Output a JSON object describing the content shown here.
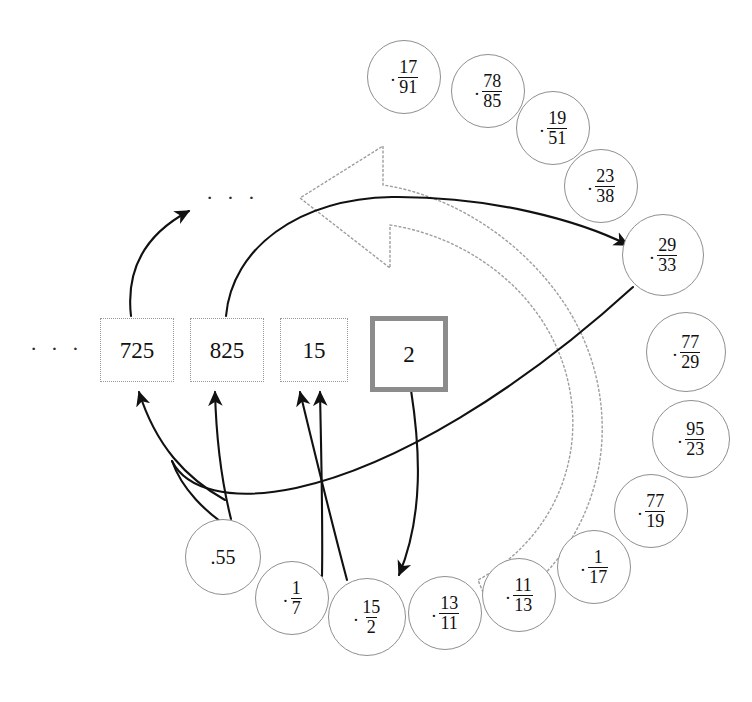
{
  "diagram": {
    "colors": {
      "box_border": "#9a9a9a",
      "active_box_border": "#8c8c8c",
      "circle_border": "#8f8f8f",
      "arrow_black": "#111111",
      "arrow_gray": "#9a9a9a",
      "background": "#ffffff"
    }
  },
  "registers": {
    "left_ellipsis": "· · ·",
    "top_ellipsis": "· · ·",
    "boxes": [
      {
        "value": "725",
        "active": false,
        "x": 100,
        "y": 318,
        "w": 72,
        "h": 62
      },
      {
        "value": "825",
        "active": false,
        "x": 190,
        "y": 318,
        "w": 72,
        "h": 62
      },
      {
        "value": "15",
        "active": false,
        "x": 280,
        "y": 318,
        "w": 66,
        "h": 62
      },
      {
        "value": "2",
        "active": true,
        "x": 370,
        "y": 316,
        "w": 68,
        "h": 66
      }
    ]
  },
  "fractions": {
    "items": [
      {
        "num": "17",
        "den": "91",
        "cx": 403,
        "cy": 76,
        "r": 36
      },
      {
        "num": "78",
        "den": "85",
        "cx": 487,
        "cy": 90,
        "r": 36
      },
      {
        "num": "19",
        "den": "51",
        "cx": 552,
        "cy": 127,
        "r": 36
      },
      {
        "num": "23",
        "den": "38",
        "cx": 600,
        "cy": 185,
        "r": 36
      },
      {
        "num": "29",
        "den": "33",
        "cx": 662,
        "cy": 254,
        "r": 40
      },
      {
        "num": "77",
        "den": "29",
        "cx": 685,
        "cy": 351,
        "r": 39
      },
      {
        "num": "95",
        "den": "23",
        "cx": 690,
        "cy": 438,
        "r": 38
      },
      {
        "num": "77",
        "den": "19",
        "cx": 650,
        "cy": 510,
        "r": 36
      },
      {
        "num": "1",
        "den": "17",
        "cx": 593,
        "cy": 566,
        "r": 36
      },
      {
        "num": "11",
        "den": "13",
        "cx": 518,
        "cy": 594,
        "r": 36
      },
      {
        "num": "13",
        "den": "11",
        "cx": 444,
        "cy": 612,
        "r": 36
      },
      {
        "num": "15",
        "den": "2",
        "cx": 366,
        "cy": 616,
        "r": 38
      },
      {
        "num": "1",
        "den": "7",
        "cx": 291,
        "cy": 597,
        "r": 36
      }
    ],
    "plain": [
      {
        "value": ".55",
        "cx": 222,
        "cy": 556,
        "r": 37
      }
    ]
  },
  "arrows": {
    "black": [
      {
        "name": "arrow-725-to-ellipsis"
      },
      {
        "name": "arrow-825-to-29-33"
      },
      {
        "name": "arrow-55-to-725"
      },
      {
        "name": "arrow-55-to-825"
      },
      {
        "name": "arrow-15over2-to-15-left"
      },
      {
        "name": "arrow-15over2-to-15-right"
      },
      {
        "name": "arrow-2-to-15over2"
      },
      {
        "name": "arrow-29-33-to-55"
      }
    ],
    "gray": [
      {
        "name": "big-cycle-arrow"
      }
    ]
  }
}
